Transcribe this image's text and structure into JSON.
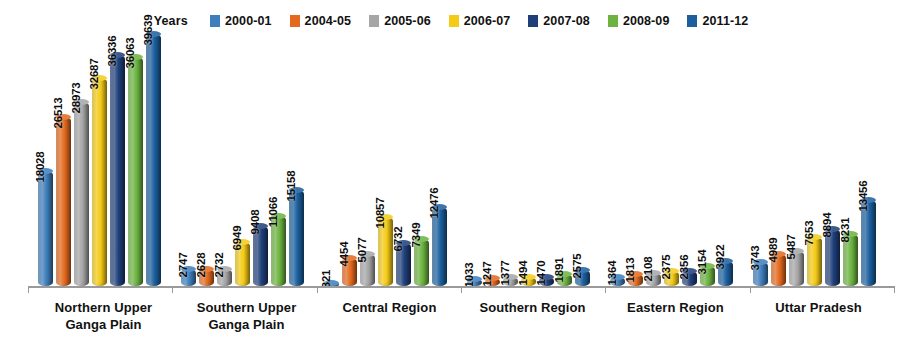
{
  "chart": {
    "type": "bar",
    "legend_title": "Years",
    "legend_position": "top-center"
  },
  "chart_data": {
    "type": "bar",
    "title": "",
    "xlabel": "",
    "ylabel": "",
    "grid": false,
    "legend_position": "top",
    "legend_title": "Years",
    "ylim": [
      0,
      39639
    ],
    "categories": [
      "Northern Upper Ganga Plain",
      "Southern Upper Ganga Plain",
      "Central Region",
      "Southern Region",
      "Eastern Region",
      "Uttar Pradesh"
    ],
    "category_lines": [
      [
        "Northern Upper",
        "Ganga Plain"
      ],
      [
        "Southern Upper",
        "Ganga Plain"
      ],
      [
        "Central Region",
        ""
      ],
      [
        "Southern Region",
        ""
      ],
      [
        "Eastern Region",
        ""
      ],
      [
        "Uttar Pradesh",
        ""
      ]
    ],
    "series": [
      {
        "name": "2000-01",
        "color": "#3d7ebb",
        "values": [
          18028,
          2747,
          321,
          1033,
          1364,
          3743
        ]
      },
      {
        "name": "2004-05",
        "color": "#e4691e",
        "values": [
          26513,
          2628,
          4454,
          1247,
          1813,
          4989
        ]
      },
      {
        "name": "2005-06",
        "color": "#a6a6a6",
        "values": [
          28973,
          2732,
          5077,
          1377,
          2108,
          5487
        ]
      },
      {
        "name": "2006-07",
        "color": "#f4cb16",
        "values": [
          32687,
          6949,
          10857,
          1494,
          2375,
          7653
        ]
      },
      {
        "name": "2007-08",
        "color": "#1f3f7a",
        "values": [
          36336,
          9408,
          6732,
          1470,
          2356,
          8894
        ]
      },
      {
        "name": "2008-09",
        "color": "#6cb33f",
        "values": [
          36063,
          11066,
          7349,
          1891,
          3154,
          8231
        ]
      },
      {
        "name": "2011-12",
        "color": "#1b5f9e",
        "values": [
          39639,
          15158,
          12476,
          2575,
          3922,
          13456
        ]
      }
    ]
  }
}
